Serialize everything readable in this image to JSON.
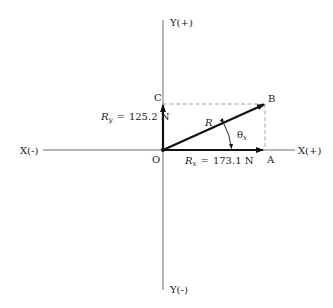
{
  "diagram": {
    "axes": {
      "x_pos": "X(+)",
      "x_neg": "X(-)",
      "y_pos": "Y(+)",
      "y_neg": "Y(-)"
    },
    "points": {
      "origin": "O",
      "a": "A",
      "b": "B",
      "c": "C"
    },
    "vectors": {
      "resultant": {
        "symbol": "R"
      },
      "rx": {
        "symbol": "R",
        "subscript": "x",
        "equals": "=",
        "value": "173.1 N"
      },
      "ry": {
        "symbol": "R",
        "subscript": "y",
        "equals": "=",
        "value": "125.2 N"
      }
    },
    "angle": {
      "symbol": "θ",
      "subscript": "x"
    },
    "colors": {
      "axis": "#6e6e6e",
      "vector": "#111111",
      "dashed": "#9a9a9a",
      "text": "#1a1a1a"
    }
  }
}
